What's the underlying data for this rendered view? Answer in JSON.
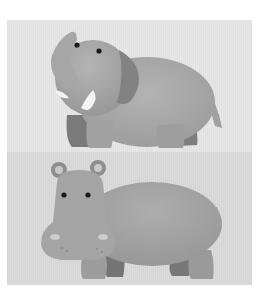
{
  "figure": {
    "panels": [
      {
        "subject": "elephant",
        "description": "Cartoon elephant facing left with raised trunk and tusks",
        "background": "#e6e6e6",
        "body_color": "#a9a9a9",
        "shade_color": "#7d7d7d"
      },
      {
        "subject": "hippopotamus",
        "description": "Cartoon hippopotamus facing left with round ears",
        "background": "#dadada",
        "body_color": "#a3a3a3",
        "shade_color": "#7a7a7a"
      }
    ]
  }
}
